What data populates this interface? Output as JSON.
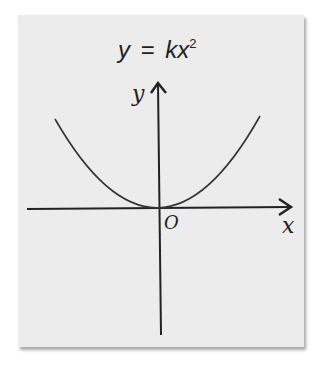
{
  "title": {
    "lhs": "y",
    "equals": "=",
    "rhs_coefficient": "k",
    "rhs_var": "x",
    "exponent": "2",
    "full": "y = kx²"
  },
  "axes": {
    "x_label": "x",
    "y_label": "y",
    "origin_label": "O"
  },
  "curve": {
    "type": "parabola",
    "equation": "y = kx^2",
    "opens": "up",
    "vertex": "origin"
  },
  "colors": {
    "card_background": "#ececec",
    "ink": "#222222"
  }
}
